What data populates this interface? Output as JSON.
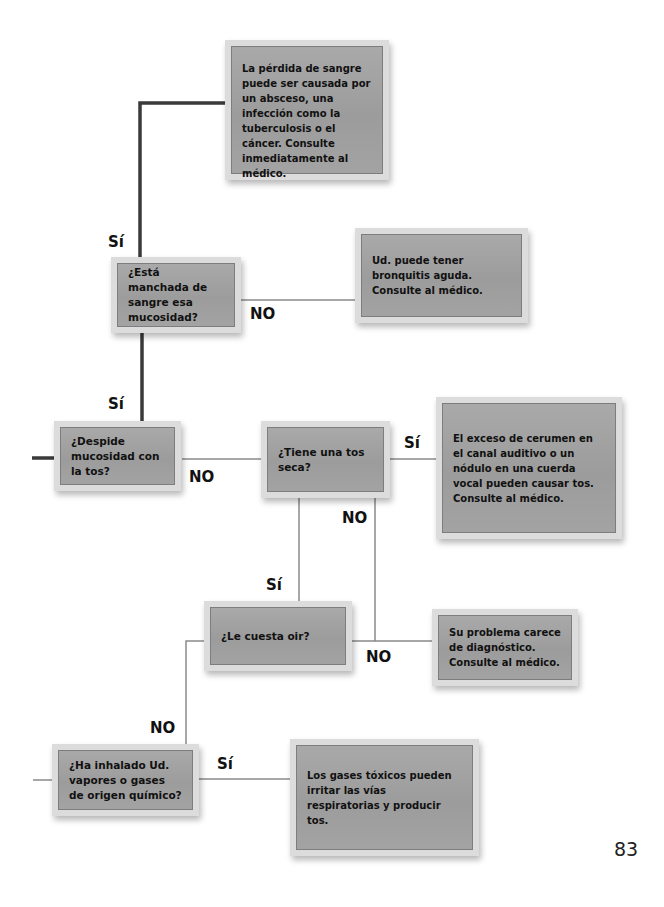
{
  "flowchart": {
    "nodes": {
      "blood_causes": "La pérdida de sangre puede ser causada por un absceso, una infección como la tuberculosis o el cáncer. Consulte inmediatamente al médico.",
      "blood_stained": "¿Está manchada de sangre esa mucosidad?",
      "bronchitis": "Ud. puede tener bronquitis aguda. Consulte al médico.",
      "phlegm": "¿Despide mucosidad con la tos?",
      "dry_cough": "¿Tiene una tos seca?",
      "earwax": "El exceso de cerumen en el canal auditivo o un nódulo en una cuerda vocal pueden causar tos. Consulte al médico.",
      "hearing": "¿Le cuesta oir?",
      "no_diagnosis": "Su problema carece de diagnóstico. Consulte al médico.",
      "fumes": "¿Ha inhalado Ud. vapores o gases de origen químico?",
      "toxic_gases": "Los gases tóxicos pueden irritar las vías respiratorias y producir tos."
    },
    "labels": {
      "yes": "Sí",
      "no": "NO"
    },
    "edges": [
      {
        "from": "phlegm",
        "to": "blood_stained",
        "label": "Sí"
      },
      {
        "from": "phlegm",
        "to": "dry_cough",
        "label": "NO"
      },
      {
        "from": "blood_stained",
        "to": "blood_causes",
        "label": "Sí"
      },
      {
        "from": "blood_stained",
        "to": "bronchitis",
        "label": "NO"
      },
      {
        "from": "dry_cough",
        "to": "earwax",
        "label": "Sí"
      },
      {
        "from": "dry_cough",
        "to": "hearing",
        "label": "Sí"
      },
      {
        "from": "dry_cough",
        "to": "no_diagnosis",
        "label": "NO"
      },
      {
        "from": "hearing",
        "to": "fumes",
        "label": "NO"
      },
      {
        "from": "fumes",
        "to": "toxic_gases",
        "label": "Sí"
      }
    ],
    "colors": {
      "box_fill": "#a3a3a3",
      "box_frame": "#dcdcdc",
      "main_line": "#333333",
      "thin_line": "#8a8a8a"
    }
  },
  "page": {
    "number": "83"
  }
}
